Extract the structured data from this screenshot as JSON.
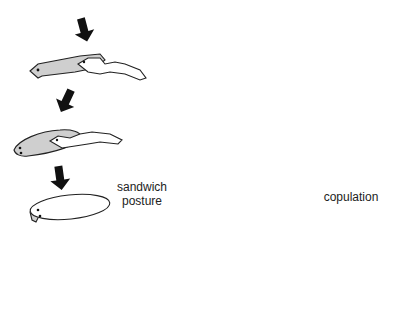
{
  "diagram": {
    "labels": {
      "sandwich": "sandwich\nposture",
      "sandwich_line1": "sandwich",
      "sandwich_line2": "posture",
      "copulation": "copulation"
    },
    "colors": {
      "gray_worm": "#cfcfcf",
      "white_worm": "#ffffff",
      "outline": "#222222",
      "arrow": "#111111"
    },
    "stages": [
      {
        "id": 1,
        "description": "gray worm with white worm overlapping on its back"
      },
      {
        "id": 2,
        "description": "gray worm with white worm on top, curving"
      },
      {
        "id": 3,
        "description": "sandwich posture: worms stacked"
      },
      {
        "id": 4,
        "description": "worms separating from sandwich"
      },
      {
        "id": 5,
        "description": "worms twisting, ventral sides together"
      },
      {
        "id": 6,
        "description": "copulation: worms end to end with tails raised"
      },
      {
        "id": 7,
        "description": "worms joined at tails"
      },
      {
        "id": 8,
        "description": "worms separating"
      }
    ]
  }
}
